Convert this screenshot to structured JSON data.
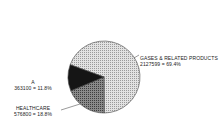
{
  "chart_data": {
    "type": "pie",
    "title": "",
    "slices": [
      {
        "label": "GASES & RELATED PRODUCTS",
        "value": 2127599,
        "percent": 69.4,
        "pattern": "light-stipple",
        "color": "#c8c8c8"
      },
      {
        "label": "HEALTHCARE",
        "value": 576800,
        "percent": 18.8,
        "pattern": "dark-stipple",
        "color": "#6e6e6e"
      },
      {
        "label": "A",
        "value": 363100,
        "percent": 11.8,
        "pattern": "solid-dark",
        "color": "#1a1a1a"
      }
    ],
    "legend": "none (direct labels)"
  },
  "labels": {
    "gases": {
      "name": "GASES & RELATED PRODUCTS",
      "value_line": "2127599  =  69.4%"
    },
    "healthcare": {
      "name": "HEALTHCARE",
      "value_line": "576800  =  18.8%"
    },
    "a": {
      "name": "A",
      "value_line": "363100  =  11.8%"
    }
  }
}
